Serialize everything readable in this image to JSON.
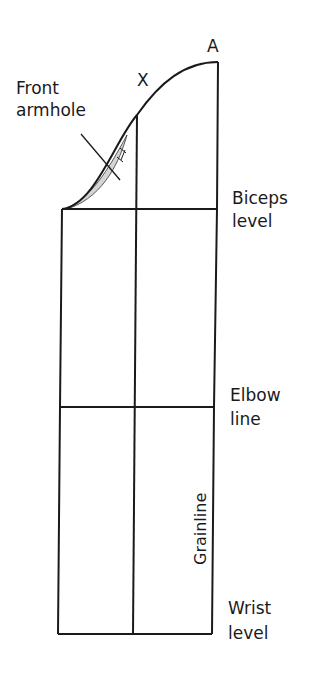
{
  "diagram": {
    "type": "sleeve-pattern-draft",
    "labels": {
      "point_a": "A",
      "point_x": "X",
      "front_armhole_line1": "Front",
      "front_armhole_line2": "armhole",
      "biceps_line1": "Biceps",
      "biceps_line2": "level",
      "elbow_line1": "Elbow",
      "elbow_line2": "line",
      "wrist_line1": "Wrist",
      "wrist_line2": "level",
      "grainline": "Grainline"
    },
    "colors": {
      "line": "#1a1a1a",
      "armhole_shading": "#d0d0d0",
      "background": "#ffffff"
    }
  }
}
